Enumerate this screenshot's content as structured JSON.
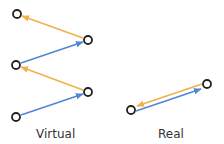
{
  "colors": {
    "orange": "#f2b04a",
    "blue": "#4f86d6",
    "node_stroke": "#222222",
    "text": "#333333"
  },
  "virtual": {
    "label": "Virtual",
    "nodes": [
      {
        "x": 17,
        "y": 14
      },
      {
        "x": 88,
        "y": 40
      },
      {
        "x": 16,
        "y": 65
      },
      {
        "x": 88,
        "y": 92
      },
      {
        "x": 16,
        "y": 117
      }
    ],
    "edges": [
      {
        "from": 1,
        "to": 0,
        "color": "orange"
      },
      {
        "from": 2,
        "to": 1,
        "color": "blue"
      },
      {
        "from": 3,
        "to": 2,
        "color": "orange"
      },
      {
        "from": 4,
        "to": 3,
        "color": "blue"
      }
    ]
  },
  "real": {
    "label": "Real",
    "nodes": [
      {
        "x": 131,
        "y": 110
      },
      {
        "x": 207,
        "y": 84
      }
    ],
    "edges": [
      {
        "from": 1,
        "to": 0,
        "color": "orange"
      },
      {
        "from": 0,
        "to": 1,
        "color": "blue"
      }
    ]
  }
}
